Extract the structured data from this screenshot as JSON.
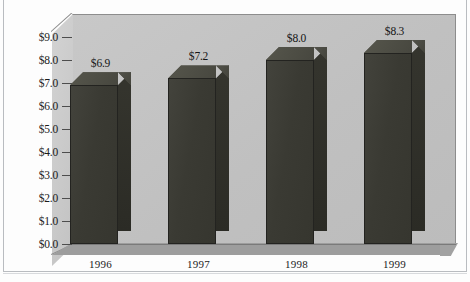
{
  "chart_data": {
    "type": "bar",
    "title": "",
    "subtitle": "",
    "xlabel": "",
    "ylabel": "",
    "categories": [
      "1996",
      "1997",
      "1998",
      "1999"
    ],
    "values": [
      6.9,
      7.2,
      8.0,
      8.3
    ],
    "data_labels": [
      "$6.9",
      "$7.2",
      "$8.0",
      "$8.3"
    ],
    "ylim": [
      0.0,
      9.0
    ],
    "ytick_values": [
      9.0,
      8.0,
      7.0,
      6.0,
      5.0,
      4.0,
      3.0,
      2.0,
      1.0,
      0.0
    ],
    "ytick_labels": [
      "$9.0",
      "$8.0",
      "$7.0",
      "$6.0",
      "$5.0",
      "$4.0",
      "$3.0",
      "$2.0",
      "$1.0",
      "$0.0"
    ],
    "grid": false,
    "legend": null,
    "legend_position": "none",
    "style": "3d-column",
    "series": [
      {
        "name": "",
        "values": [
          6.9,
          7.2,
          8.0,
          8.3
        ]
      }
    ],
    "colors": {
      "bar_front": "#3c3c35",
      "bar_top": "#4e4e45",
      "bar_side": "#2e2e28",
      "back_wall": "#c3c3c3",
      "side_wall": "#cccccc",
      "floor": "#9d9d9d",
      "axis_line": "#7a7a7a",
      "text": "#1b1b1b",
      "page_background": "#fdfdfd",
      "frame_line": "#b9bcc0"
    }
  }
}
